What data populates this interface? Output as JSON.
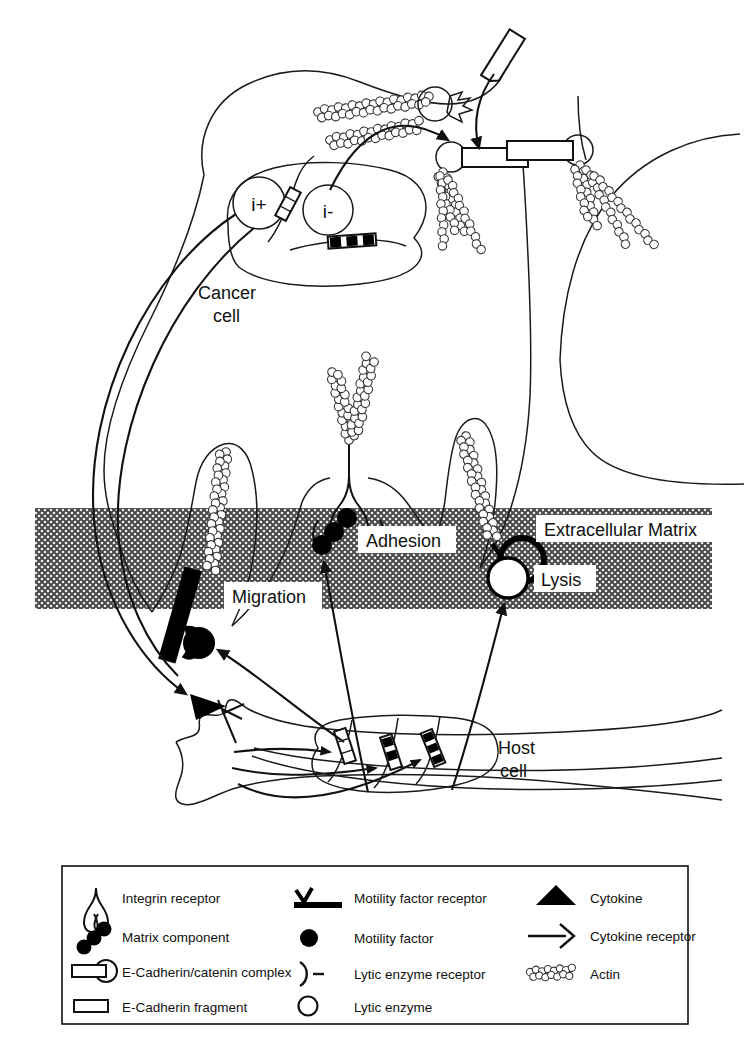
{
  "figure": {
    "background_color": "#ffffff",
    "ink_color": "#111111",
    "ecm_fill_color": "#9a9a9a"
  },
  "labels": {
    "cancer_cell_line1": "Cancer",
    "cancer_cell_line2": "cell",
    "host_cell_line1": "Host",
    "host_cell_line2": "cell",
    "extracellular_matrix": "Extracellular Matrix",
    "adhesion": "Adhesion",
    "migration": "Migration",
    "lysis": "Lysis",
    "gene_positive": "i+",
    "gene_negative": "i-"
  },
  "legend": {
    "columns": [
      {
        "items": [
          {
            "icon": "integrin-receptor-icon",
            "label": "Integrin receptor"
          },
          {
            "icon": "matrix-component-icon",
            "label": "Matrix component"
          },
          {
            "icon": "e-cadherin-catenin-complex-icon",
            "label": "E-Cadherin/catenin complex"
          },
          {
            "icon": "e-cadherin-fragment-icon",
            "label": "E-Cadherin fragment"
          }
        ]
      },
      {
        "items": [
          {
            "icon": "motility-factor-receptor-icon",
            "label": "Motility factor receptor"
          },
          {
            "icon": "motility-factor-icon",
            "label": "Motility factor"
          },
          {
            "icon": "lytic-enzyme-receptor-icon",
            "label": "Lytic enzyme receptor"
          },
          {
            "icon": "lytic-enzyme-icon",
            "label": "Lytic enzyme"
          }
        ]
      },
      {
        "items": [
          {
            "icon": "cytokine-icon",
            "label": "Cytokine"
          },
          {
            "icon": "cytokine-receptor-icon",
            "label": "Cytokine receptor"
          },
          {
            "icon": "actin-icon",
            "label": "Actin"
          }
        ]
      }
    ]
  },
  "diagram_elements": {
    "cancer_cell": "large cell occupying upper two thirds of the figure",
    "neighbouring_cell": "partial cell outline at upper right",
    "host_cell": "elongated spindle shaped cell at the bottom",
    "nucleus_cancer": "oval nucleus containing i+ and i- gene circles",
    "nucleus_host": "oval nucleus containing three gene segments",
    "ecm_band": "hatched horizontal band across the middle of the figure"
  }
}
